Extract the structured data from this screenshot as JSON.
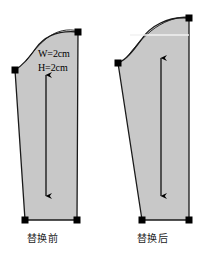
{
  "figure": {
    "title_before": "替换前",
    "title_after": "替换后",
    "background_color": "#ffffff",
    "shape_fill_color": "#c8c8c8",
    "shape_stroke_color": "#1a1a1a",
    "handle_color": "#000000",
    "arrow_color": "#000000",
    "guide_line_color": "#f2f2f2"
  },
  "panel_before": {
    "caption": "替换前",
    "labels": {
      "width": "W=2cm",
      "height": "H=2cm"
    },
    "handles": [
      {
        "name": "shoulder-point",
        "x": 15,
        "y": 70
      },
      {
        "name": "top-right-point",
        "x": 78,
        "y": 32
      },
      {
        "name": "bottom-left-point",
        "x": 25,
        "y": 220
      },
      {
        "name": "bottom-right-point",
        "x": 77,
        "y": 220
      }
    ],
    "arrow": {
      "x": 46,
      "y_top": 75,
      "y_bottom": 196,
      "double_headed": true
    }
  },
  "panel_after": {
    "caption": "替换后",
    "handles": [
      {
        "name": "shoulder-point",
        "x": 118,
        "y": 63
      },
      {
        "name": "top-right-point",
        "x": 189,
        "y": 18
      },
      {
        "name": "bottom-left-point",
        "x": 142,
        "y": 220
      },
      {
        "name": "bottom-right-point",
        "x": 189,
        "y": 220
      }
    ],
    "arrow": {
      "x": 161,
      "y_top": 58,
      "y_bottom": 196,
      "double_headed": true
    },
    "guide_line": {
      "x_start": 130,
      "x_end": 189,
      "y": 35
    }
  }
}
